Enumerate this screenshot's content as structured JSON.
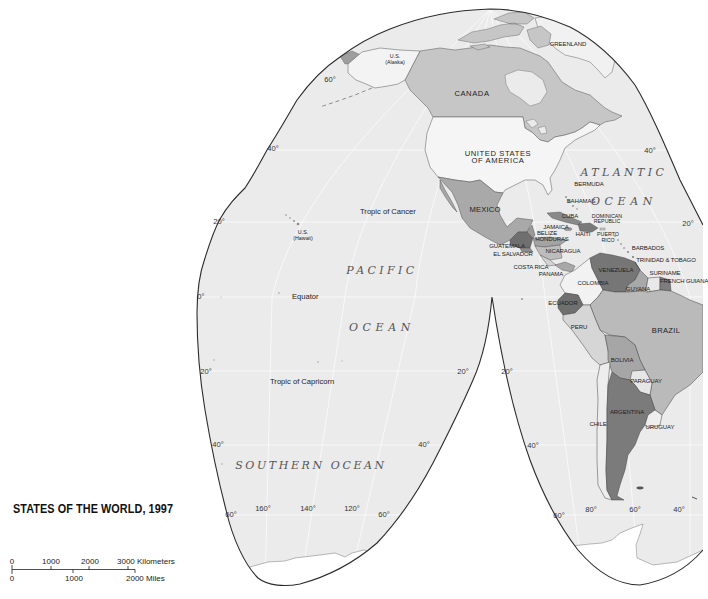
{
  "title": "STATES OF THE WORLD,  1997",
  "scale_bar": {
    "km": [
      "0",
      "1000",
      "2000",
      "3000 Kilometers"
    ],
    "miles": [
      "0",
      "1000",
      "2000 Miles"
    ]
  },
  "oceans": {
    "atlantic_line1": "ATLANTIC",
    "atlantic_line2": "OCEAN",
    "pacific_line1": "PACIFIC",
    "pacific_line2": "OCEAN",
    "southern": "SOUTHERN OCEAN"
  },
  "lines": {
    "tropic_of_cancer": "Tropic of Cancer",
    "equator": "Equator",
    "tropic_of_capricorn": "Tropic of Capricorn"
  },
  "countries": {
    "greenland": "GREENLAND",
    "us_alaska": [
      "U.S.",
      "(Alaska)"
    ],
    "canada": "CANADA",
    "usa": [
      "UNITED STATES",
      "OF AMERICA"
    ],
    "bermuda": "BERMUDA",
    "mexico": "MEXICO",
    "bahamas": "BAHAMAS",
    "cuba": "CUBA",
    "dominican_republic": [
      "DOMINICAN",
      "REPUBLIC"
    ],
    "jamaica": "JAMAICA",
    "us_hawaii": [
      "U.S.",
      "(Hawaii)"
    ],
    "belize": "BELIZE",
    "haiti": "HAITI",
    "puerto_rico": [
      "PUERTO",
      "RICO"
    ],
    "honduras": "HONDURAS",
    "guatemala": "GUATEMALA",
    "barbados": "BARBADOS",
    "nicaragua": "NICARAGUA",
    "el_salvador": "EL SALVADOR",
    "trinidad_tobago": "TRINIDAD & TOBAGO",
    "costa_rica": "COSTA RICA",
    "venezuela": "VENEZUELA",
    "suriname": "SURINAME",
    "panama": "PANAMA",
    "french_guiana": "FRENCH GUIANA",
    "colombia": "COLOMBIA",
    "guyana": "GUYANA",
    "ecuador": "ECUADOR",
    "brazil": "BRAZIL",
    "peru": "PERU",
    "bolivia": "BOLIVIA",
    "paraguay": "PARAGUAY",
    "argentina": "ARGENTINA",
    "chile": "CHILE",
    "uruguay": "URUGUAY"
  },
  "graticule": {
    "lat_60n_west": "60°",
    "lat_40n_west": "40°",
    "lat_40n_east": "40°",
    "lat_20n_west": "20°",
    "lat_20n_east": "20°",
    "lat_0": "0°",
    "lat_20s_west": "20°",
    "lat_20s_cusp_left": "20°",
    "lat_20s_cusp_right": "20°",
    "lat_40s_west": "40°",
    "lat_40s_cusp_left": "40°",
    "lat_40s_cusp_right": "40°",
    "lat_60s_west": "60°",
    "lat_60s_cusp_left": "60°",
    "lat_60s_right_lobe": "60°",
    "lon_160": "160°",
    "lon_140": "140°",
    "lon_120": "120°",
    "lon_80": "80°",
    "lon_60": "60°",
    "lon_40": "40°"
  },
  "colors": {
    "ocean": "#ebebeb",
    "outline": "#2b2b2b",
    "graticule": "#f9f9f9",
    "antarctica": "#ffffff",
    "greenland": "#f1f1f1",
    "russia": "#9e9e9e",
    "alaska": "#f3f3f3",
    "canada": "#c6c6c6",
    "usa": "#f5f5f5",
    "mexico": "#a9a9a9",
    "guatemala": "#6f6f6f",
    "belize": "#9a9a9a",
    "honduras": "#a3a3a3",
    "el_salvador": "#8c8c8c",
    "nicaragua": "#bdbdbd",
    "costa_rica": "#d2d2d2",
    "panama": "#a8a8a8",
    "cuba": "#8a8a8a",
    "hispaniola": "#7a7a7a",
    "jamaica": "#9a9a9a",
    "venezuela": "#767676",
    "colombia": "#f2f2f2",
    "ecuador": "#6f6f6f",
    "peru": "#d6d6d6",
    "brazil": "#bababa",
    "bolivia": "#a6a6a6",
    "paraguay": "#e6e6e6",
    "argentina": "#7b7b7b",
    "chile": "#ededed",
    "uruguay": "#eeeeee",
    "guyana": "#a8a8a8",
    "suriname": "#e8e8e8",
    "french_guiana": "#7d7d7d"
  }
}
